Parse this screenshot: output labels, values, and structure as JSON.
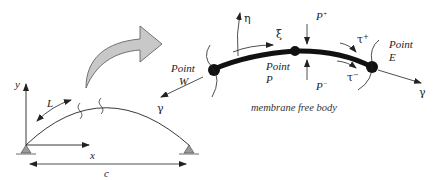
{
  "diagram": {
    "caption": "membrane free body",
    "arch": {
      "axis_x_label": "x",
      "axis_y_label": "y",
      "length_label": "L",
      "span_label": "c",
      "direction_label": "γ"
    },
    "free_body": {
      "point_w": {
        "line1": "Point",
        "line2": "W"
      },
      "point_p": {
        "line1": "Point",
        "line2": "P"
      },
      "point_e": {
        "line1": "Point",
        "line2": "E"
      },
      "eta_label": "η",
      "xi_label": "ξ",
      "p_plus": {
        "base": "P",
        "sup": "+"
      },
      "p_minus": {
        "base": "P",
        "sup": "−"
      },
      "tau_plus": {
        "base": "τ",
        "sup": "+"
      },
      "tau_minus": {
        "base": "τ",
        "sup": "−"
      },
      "gamma_right": "γ"
    },
    "colors": {
      "line": "#222222",
      "arrow_fill": "#c8c8c8",
      "arrow_stroke": "#555555",
      "support_fill": "#9a9a9a"
    }
  }
}
